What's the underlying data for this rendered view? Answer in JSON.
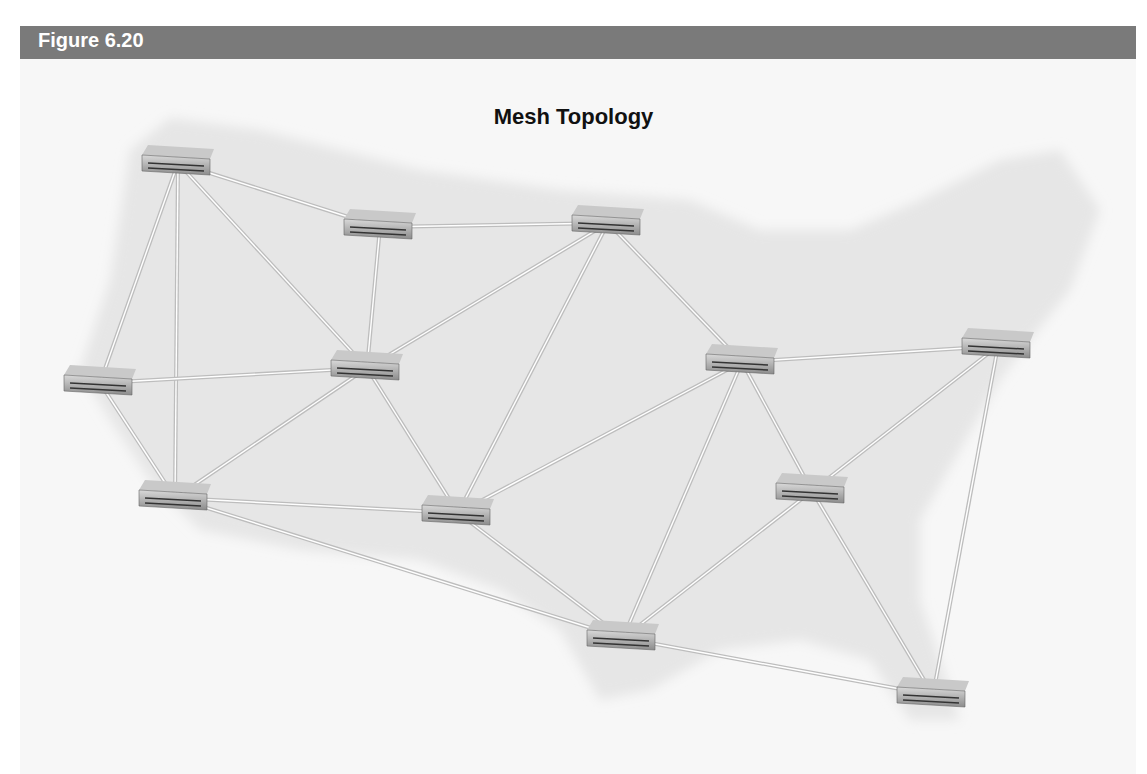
{
  "header": {
    "figure_label": "Figure 6.20"
  },
  "diagram": {
    "title": "Mesh Topology",
    "background_map": "continental-united-states",
    "node_type": "network-switch",
    "nodes": [
      {
        "id": "n1",
        "x": 178,
        "y": 163
      },
      {
        "id": "n2",
        "x": 380,
        "y": 227
      },
      {
        "id": "n3",
        "x": 608,
        "y": 223
      },
      {
        "id": "n4",
        "x": 100,
        "y": 383
      },
      {
        "id": "n5",
        "x": 367,
        "y": 368
      },
      {
        "id": "n6",
        "x": 742,
        "y": 362
      },
      {
        "id": "n7",
        "x": 998,
        "y": 346
      },
      {
        "id": "n8",
        "x": 175,
        "y": 498
      },
      {
        "id": "n9",
        "x": 458,
        "y": 513
      },
      {
        "id": "n10",
        "x": 812,
        "y": 491
      },
      {
        "id": "n11",
        "x": 623,
        "y": 638
      },
      {
        "id": "n12",
        "x": 933,
        "y": 695
      }
    ],
    "links": [
      [
        "n1",
        "n2"
      ],
      [
        "n1",
        "n4"
      ],
      [
        "n1",
        "n5"
      ],
      [
        "n1",
        "n8"
      ],
      [
        "n2",
        "n3"
      ],
      [
        "n2",
        "n5"
      ],
      [
        "n3",
        "n5"
      ],
      [
        "n3",
        "n6"
      ],
      [
        "n3",
        "n9"
      ],
      [
        "n4",
        "n5"
      ],
      [
        "n4",
        "n8"
      ],
      [
        "n5",
        "n8"
      ],
      [
        "n5",
        "n9"
      ],
      [
        "n6",
        "n7"
      ],
      [
        "n6",
        "n9"
      ],
      [
        "n6",
        "n10"
      ],
      [
        "n6",
        "n11"
      ],
      [
        "n7",
        "n10"
      ],
      [
        "n7",
        "n12"
      ],
      [
        "n8",
        "n9"
      ],
      [
        "n8",
        "n11"
      ],
      [
        "n9",
        "n11"
      ],
      [
        "n10",
        "n11"
      ],
      [
        "n10",
        "n12"
      ],
      [
        "n11",
        "n12"
      ]
    ]
  }
}
